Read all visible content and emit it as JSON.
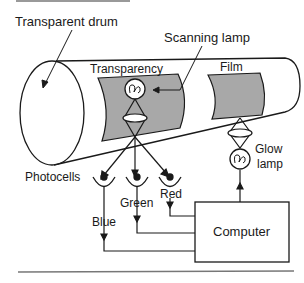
{
  "diagram": {
    "labels": {
      "drum": "Transparent drum",
      "scanning_lamp": "Scanning lamp",
      "transparency": "Transparency",
      "film": "Film",
      "photocells": "Photocells",
      "red": "Red",
      "green": "Green",
      "blue": "Blue",
      "glow_lamp_1": "Glow",
      "glow_lamp_2": "lamp",
      "computer": "Computer"
    },
    "colors": {
      "line": "#1a1a1a",
      "sheet_fill": "#a8a8a8",
      "background": "#ffffff"
    }
  }
}
